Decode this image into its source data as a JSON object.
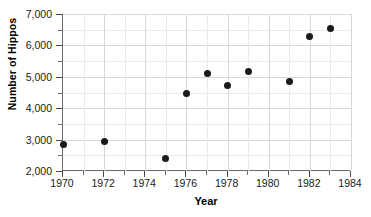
{
  "chart_data": {
    "type": "scatter",
    "title": "",
    "xlabel": "Year",
    "ylabel": "Number of Hippos",
    "xlim": [
      1970,
      1984
    ],
    "ylim": [
      2000,
      7000
    ],
    "grid": true,
    "legend": "none",
    "x_major_ticks": [
      1970,
      1972,
      1974,
      1976,
      1978,
      1980,
      1982,
      1984
    ],
    "x_minor_ticks": [
      1971,
      1973,
      1975,
      1977,
      1979,
      1981,
      1983
    ],
    "x_tick_labels": [
      "1970",
      "1972",
      "1974",
      "1976",
      "1978",
      "1980",
      "1982",
      "1984"
    ],
    "y_major_ticks": [
      2000,
      3000,
      4000,
      5000,
      6000,
      7000
    ],
    "y_minor_ticks": [
      2500,
      3500,
      4500,
      5500,
      6500
    ],
    "y_tick_labels": [
      "2,000",
      "3,000",
      "4,000",
      "5,000",
      "6,000",
      "7,000"
    ],
    "x": [
      1970,
      1972,
      1975,
      1976,
      1977,
      1978,
      1979,
      1981,
      1982,
      1983
    ],
    "values": [
      2830,
      2950,
      2400,
      4480,
      5120,
      4730,
      5170,
      4850,
      6270,
      6530
    ],
    "points": [
      {
        "year": 1970,
        "hippos": 2830
      },
      {
        "year": 1972,
        "hippos": 2950
      },
      {
        "year": 1975,
        "hippos": 2400
      },
      {
        "year": 1976,
        "hippos": 4480
      },
      {
        "year": 1977,
        "hippos": 5120
      },
      {
        "year": 1978,
        "hippos": 4730
      },
      {
        "year": 1979,
        "hippos": 5170
      },
      {
        "year": 1981,
        "hippos": 4850
      },
      {
        "year": 1982,
        "hippos": 6270
      },
      {
        "year": 1983,
        "hippos": 6530
      }
    ],
    "marker": {
      "shape": "circle",
      "color": "#1a1a1a",
      "size": 7
    },
    "colors": {
      "background": "#ffffff",
      "grid": "#d8d8d8",
      "axis": "#6b6b6b",
      "text": "#1a1a1a",
      "marker": "#1a1a1a"
    }
  }
}
